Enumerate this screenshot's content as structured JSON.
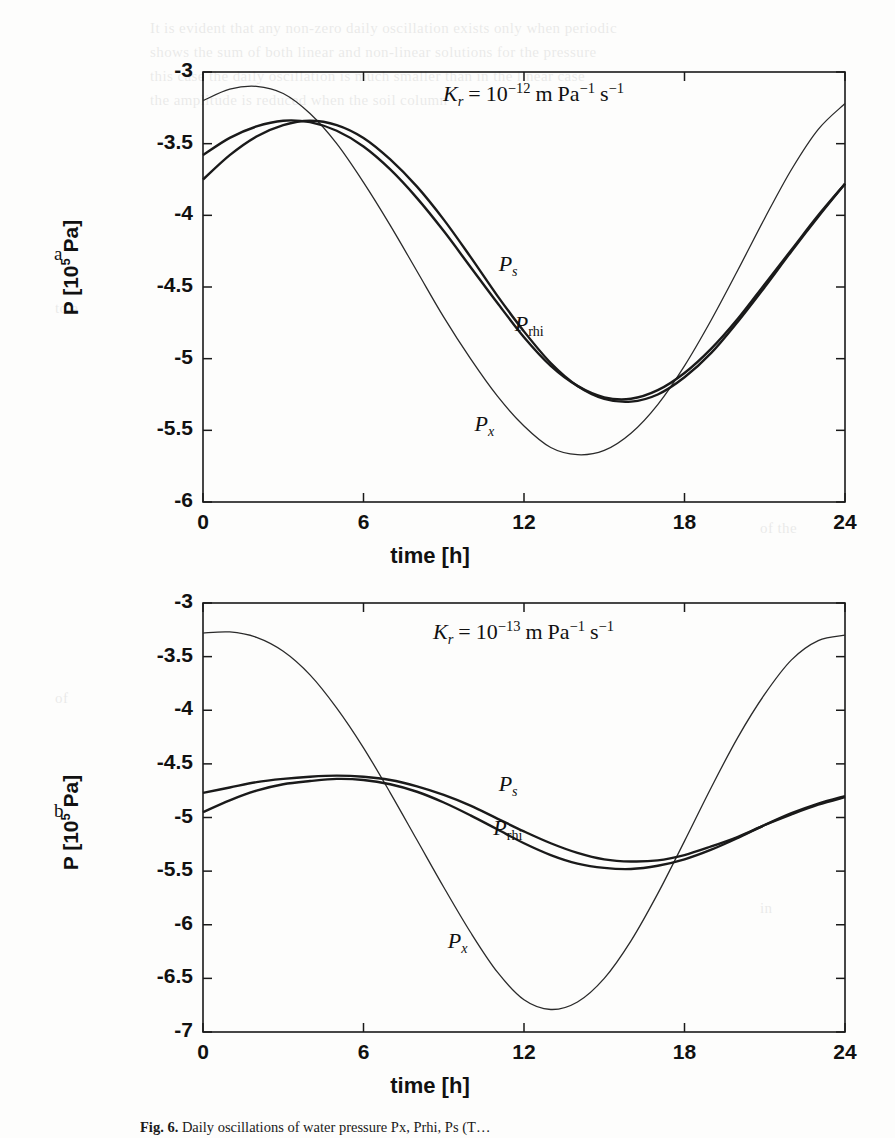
{
  "figure": {
    "caption_prefix": "Fig. 6.",
    "caption_text": "Daily oscillations of water pressure Px, Prhi, Ps (T…",
    "panels": [
      "a",
      "b"
    ]
  },
  "panel_a": {
    "letter": "a",
    "annotation": {
      "symbol": "K",
      "subscript": "r",
      "equals": "=",
      "base": "10",
      "exponent": "−12",
      "units": "m Pa−1 s−1",
      "unit_m": "m",
      "unit_pa": "Pa",
      "unit_pa_exp": "−1",
      "unit_s": "s",
      "unit_s_exp": "−1"
    },
    "xlabel": "time [h]",
    "ylabel_prefix": "P [10",
    "ylabel_exp": "5",
    "ylabel_suffix": " Pa]",
    "xticks": [
      "0",
      "6",
      "12",
      "18",
      "24"
    ],
    "yticks": [
      "-3",
      "-3.5",
      "-4",
      "-4.5",
      "-5",
      "-5.5",
      "-6"
    ],
    "curve_labels": [
      {
        "name": "P_s",
        "base": "P",
        "sub": "s",
        "sub_upright": false
      },
      {
        "name": "P_rhi",
        "base": "P",
        "sub": "rhi",
        "sub_upright": true
      },
      {
        "name": "P_x",
        "base": "P",
        "sub": "x",
        "sub_upright": false
      }
    ]
  },
  "panel_b": {
    "letter": "b",
    "annotation": {
      "symbol": "K",
      "subscript": "r",
      "equals": "=",
      "base": "10",
      "exponent": "−13",
      "units": "m Pa−1 s−1",
      "unit_m": "m",
      "unit_pa": "Pa",
      "unit_pa_exp": "−1",
      "unit_s": "s",
      "unit_s_exp": "−1"
    },
    "xlabel": "time [h]",
    "ylabel_prefix": "P [10",
    "ylabel_exp": "5",
    "ylabel_suffix": " Pa]",
    "xticks": [
      "0",
      "6",
      "12",
      "18",
      "24"
    ],
    "yticks": [
      "-3",
      "-3.5",
      "-4",
      "-4.5",
      "-5",
      "-5.5",
      "-6",
      "-6.5",
      "-7"
    ],
    "curve_labels": [
      {
        "name": "P_s",
        "base": "P",
        "sub": "s",
        "sub_upright": false
      },
      {
        "name": "P_rhi",
        "base": "P",
        "sub": "rhi",
        "sub_upright": true
      },
      {
        "name": "P_x",
        "base": "P",
        "sub": "x",
        "sub_upright": false
      }
    ]
  },
  "ghost_lines": [
    {
      "x": 150,
      "y": 20,
      "text": "It is evident that any non-zero daily oscillation exists only when periodic"
    },
    {
      "x": 150,
      "y": 44,
      "text": "shows the sum of both linear and non-linear solutions for the pressure"
    },
    {
      "x": 150,
      "y": 68,
      "text": "this case the daily oscillation is much smaller than in the linear case"
    },
    {
      "x": 150,
      "y": 92,
      "text": "the amplitude is reduced when the soil column"
    },
    {
      "x": 55,
      "y": 300,
      "text": "to a"
    },
    {
      "x": 55,
      "y": 690,
      "text": "of"
    },
    {
      "x": 760,
      "y": 520,
      "text": "of the"
    },
    {
      "x": 760,
      "y": 900,
      "text": "in"
    }
  ],
  "chart_data": [
    {
      "id": "panel_a",
      "type": "line",
      "title": "",
      "xlabel": "time [h]",
      "ylabel": "P [10^5 Pa]",
      "annotation": "K_r = 10^-12 m Pa^-1 s^-1",
      "panel_letter": "a",
      "xlim": [
        0,
        24
      ],
      "ylim": [
        -6,
        -3
      ],
      "xticks": [
        0,
        6,
        12,
        18,
        24
      ],
      "yticks": [
        -3,
        -3.5,
        -4,
        -4.5,
        -5,
        -5.5,
        -6
      ],
      "grid": false,
      "legend": "inline-curve-labels",
      "x": [
        0,
        1,
        2,
        3,
        4,
        5,
        6,
        7,
        8,
        9,
        10,
        11,
        12,
        13,
        14,
        15,
        16,
        17,
        18,
        19,
        20,
        21,
        22,
        23,
        24
      ],
      "series": [
        {
          "name": "P_x",
          "style": "thin",
          "label_pos": [
            10.6,
            -5.48
          ],
          "values": [
            -3.2,
            -3.12,
            -3.1,
            -3.15,
            -3.29,
            -3.5,
            -3.77,
            -4.07,
            -4.39,
            -4.71,
            -5.0,
            -5.26,
            -5.47,
            -5.62,
            -5.67,
            -5.64,
            -5.52,
            -5.32,
            -5.05,
            -4.73,
            -4.38,
            -4.02,
            -3.68,
            -3.4,
            -3.22
          ]
        },
        {
          "name": "P_rhi",
          "style": "thick",
          "label_pos": [
            12.1,
            -4.78
          ],
          "values": [
            -3.75,
            -3.58,
            -3.45,
            -3.37,
            -3.34,
            -3.37,
            -3.46,
            -3.61,
            -3.8,
            -4.03,
            -4.29,
            -4.56,
            -4.81,
            -5.03,
            -5.19,
            -5.28,
            -5.3,
            -5.25,
            -5.13,
            -4.96,
            -4.74,
            -4.5,
            -4.25,
            -4.01,
            -3.78
          ]
        },
        {
          "name": "P_s",
          "style": "thick",
          "label_pos": [
            11.5,
            -4.36
          ],
          "values": [
            -3.58,
            -3.46,
            -3.38,
            -3.34,
            -3.35,
            -3.41,
            -3.52,
            -3.68,
            -3.88,
            -4.11,
            -4.36,
            -4.61,
            -4.85,
            -5.05,
            -5.19,
            -5.27,
            -5.28,
            -5.22,
            -5.1,
            -4.93,
            -4.72,
            -4.48,
            -4.24,
            -4.0,
            -3.78
          ]
        }
      ]
    },
    {
      "id": "panel_b",
      "type": "line",
      "title": "",
      "xlabel": "time [h]",
      "ylabel": "P [10^5 Pa]",
      "annotation": "K_r = 10^-13 m Pa^-1 s^-1",
      "panel_letter": "b",
      "xlim": [
        0,
        24
      ],
      "ylim": [
        -7,
        -3
      ],
      "xticks": [
        0,
        6,
        12,
        18,
        24
      ],
      "yticks": [
        -3,
        -3.5,
        -4,
        -4.5,
        -5,
        -5.5,
        -6,
        -6.5,
        -7
      ],
      "grid": false,
      "legend": "inline-curve-labels",
      "x": [
        0,
        1,
        2,
        3,
        4,
        5,
        6,
        7,
        8,
        9,
        10,
        11,
        12,
        13,
        14,
        15,
        16,
        17,
        18,
        19,
        20,
        21,
        22,
        23,
        24
      ],
      "series": [
        {
          "name": "P_x",
          "style": "thin",
          "label_pos": [
            9.6,
            -6.18
          ],
          "values": [
            -3.28,
            -3.27,
            -3.32,
            -3.45,
            -3.67,
            -3.98,
            -4.35,
            -4.77,
            -5.21,
            -5.65,
            -6.07,
            -6.44,
            -6.7,
            -6.79,
            -6.72,
            -6.5,
            -6.15,
            -5.71,
            -5.22,
            -4.72,
            -4.25,
            -3.85,
            -3.53,
            -3.35,
            -3.3
          ]
        },
        {
          "name": "P_rhi",
          "style": "thick",
          "label_pos": [
            11.3,
            -5.13
          ],
          "values": [
            -4.95,
            -4.84,
            -4.75,
            -4.69,
            -4.66,
            -4.64,
            -4.65,
            -4.69,
            -4.76,
            -4.86,
            -4.98,
            -5.11,
            -5.24,
            -5.35,
            -5.43,
            -5.47,
            -5.48,
            -5.45,
            -5.39,
            -5.3,
            -5.19,
            -5.07,
            -4.96,
            -4.87,
            -4.8
          ]
        },
        {
          "name": "P_s",
          "style": "thick",
          "label_pos": [
            11.5,
            -4.72
          ],
          "values": [
            -4.77,
            -4.72,
            -4.67,
            -4.64,
            -4.62,
            -4.61,
            -4.62,
            -4.65,
            -4.71,
            -4.79,
            -4.89,
            -5.01,
            -5.13,
            -5.24,
            -5.33,
            -5.39,
            -5.41,
            -5.4,
            -5.35,
            -5.27,
            -5.18,
            -5.07,
            -4.97,
            -4.88,
            -4.81
          ]
        }
      ]
    }
  ]
}
